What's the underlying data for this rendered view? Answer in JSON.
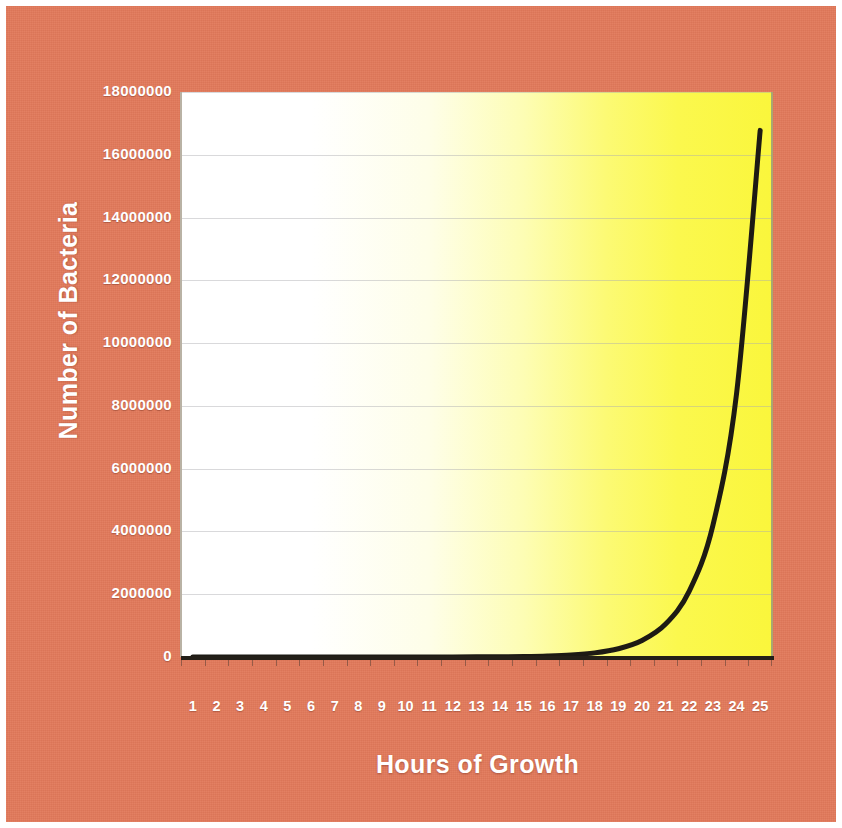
{
  "figure": {
    "background_color": "#e2795a",
    "outer_border_color": "#ffffff",
    "label_color": "#ffffff"
  },
  "chart_data": {
    "type": "line",
    "title": "",
    "subtitle": "",
    "xlabel": "Hours of Growth",
    "ylabel": "Number of Bacteria",
    "x": [
      1,
      2,
      3,
      4,
      5,
      6,
      7,
      8,
      9,
      10,
      11,
      12,
      13,
      14,
      15,
      16,
      17,
      18,
      19,
      20,
      21,
      22,
      23,
      24,
      25
    ],
    "values": [
      1,
      2,
      4,
      8,
      16,
      32,
      64,
      128,
      256,
      512,
      1024,
      2048,
      4096,
      8192,
      16384,
      32768,
      65536,
      131072,
      262144,
      524288,
      1048576,
      2097152,
      4194304,
      8388608,
      16777216
    ],
    "series": [
      {
        "name": "Bacteria count",
        "values": [
          1,
          2,
          4,
          8,
          16,
          32,
          64,
          128,
          256,
          512,
          1024,
          2048,
          4096,
          8192,
          16384,
          32768,
          65536,
          131072,
          262144,
          524288,
          1048576,
          2097152,
          4194304,
          8388608,
          16777216
        ],
        "line_color": "#1d1a14",
        "line_width": 5
      }
    ],
    "x_tick_labels": [
      "1",
      "2",
      "3",
      "4",
      "5",
      "6",
      "7",
      "8",
      "9",
      "10",
      "11",
      "12",
      "13",
      "14",
      "15",
      "16",
      "17",
      "18",
      "19",
      "20",
      "21",
      "22",
      "23",
      "24",
      "25"
    ],
    "y_tick_labels": [
      "0",
      "2000000",
      "4000000",
      "6000000",
      "8000000",
      "10000000",
      "12000000",
      "14000000",
      "16000000",
      "18000000"
    ],
    "y_tick_values": [
      0,
      2000000,
      4000000,
      6000000,
      8000000,
      10000000,
      12000000,
      14000000,
      16000000,
      18000000
    ],
    "ylim": [
      0,
      18000000
    ],
    "xlim": [
      1,
      25
    ],
    "grid": true,
    "grid_axis": "y",
    "legend": "none",
    "plot_background": "white-to-yellow horizontal gradient",
    "plot_background_start_color": "#ffffff",
    "plot_background_end_color": "#faf63c"
  }
}
